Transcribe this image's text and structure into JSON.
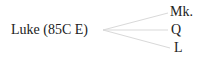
{
  "diagram": {
    "source": {
      "label": "Luke (85C E)"
    },
    "targets": [
      {
        "label": "Mk."
      },
      {
        "label": "Q"
      },
      {
        "label": "L"
      }
    ],
    "edge_color": "#d9d9d9"
  }
}
